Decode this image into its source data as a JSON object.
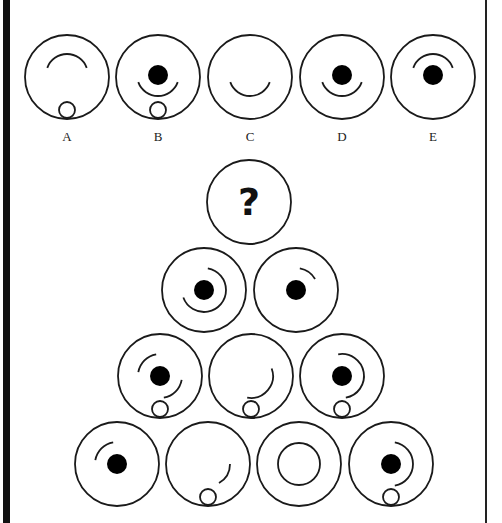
{
  "puzzle": {
    "type": "pyramid-circle-sequence",
    "question_mark": "?",
    "stroke_color": "#1a1a1a",
    "fill_color": "#000000",
    "options": [
      {
        "label": "A",
        "cx": 67,
        "cy": 77,
        "dot": false,
        "arc": {
          "start": 200,
          "end": 340,
          "r": 21
        },
        "small_circle": true
      },
      {
        "label": "B",
        "cx": 158,
        "cy": 77,
        "dot": true,
        "arc": {
          "start": 20,
          "end": 160,
          "r": 21
        },
        "small_circle": true
      },
      {
        "label": "C",
        "cx": 250,
        "cy": 77,
        "dot": false,
        "arc": {
          "start": 20,
          "end": 160,
          "r": 21
        },
        "small_circle": false
      },
      {
        "label": "D",
        "cx": 342,
        "cy": 77,
        "dot": true,
        "arc": {
          "start": 20,
          "end": 160,
          "r": 21
        },
        "small_circle": false
      },
      {
        "label": "E",
        "cx": 433,
        "cy": 77,
        "dot": true,
        "arc": {
          "start": 200,
          "end": 340,
          "r": 21
        },
        "small_circle": false
      }
    ],
    "pyramid": [
      {
        "row": 0,
        "cx": 249,
        "cy": 202,
        "question": true
      },
      {
        "row": 1,
        "cx": 204,
        "cy": 290,
        "dot": true,
        "arc": {
          "start": 280,
          "end": 160,
          "r": 22
        },
        "small_circle": false
      },
      {
        "row": 1,
        "cx": 296,
        "cy": 290,
        "dot": true,
        "arc": {
          "start": 280,
          "end": 330,
          "r": 22
        },
        "small_circle": false
      },
      {
        "row": 2,
        "cx": 160,
        "cy": 376,
        "dot": true,
        "arcs": [
          {
            "start": 190,
            "end": 260,
            "r": 22
          },
          {
            "start": 10,
            "end": 80,
            "r": 22
          }
        ],
        "small_circle": true
      },
      {
        "row": 2,
        "cx": 251,
        "cy": 376,
        "dot": false,
        "arc": {
          "start": 340,
          "end": 100,
          "r": 22
        },
        "small_circle": true
      },
      {
        "row": 2,
        "cx": 342,
        "cy": 376,
        "dot": true,
        "arc": {
          "start": 260,
          "end": 80,
          "r": 22
        },
        "small_circle": true
      },
      {
        "row": 3,
        "cx": 117,
        "cy": 464,
        "dot": true,
        "arc": {
          "start": 190,
          "end": 260,
          "r": 22
        },
        "small_circle": false
      },
      {
        "row": 3,
        "cx": 208,
        "cy": 464,
        "dot": false,
        "arc": {
          "start": 0,
          "end": 60,
          "r": 22
        },
        "small_circle": true
      },
      {
        "row": 3,
        "cx": 299,
        "cy": 464,
        "dot": false,
        "full_circle": {
          "r": 21
        },
        "small_circle": false
      },
      {
        "row": 3,
        "cx": 391,
        "cy": 464,
        "dot": true,
        "arc": {
          "start": 280,
          "end": 80,
          "r": 22
        },
        "small_circle": true
      }
    ]
  }
}
